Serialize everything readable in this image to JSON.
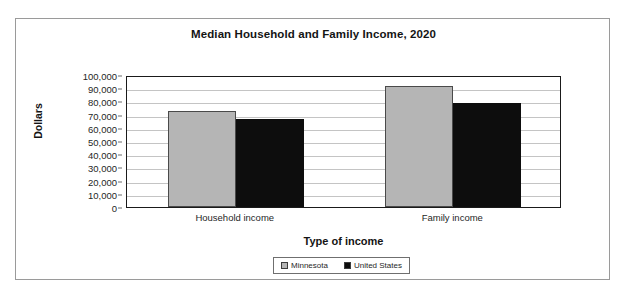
{
  "chart_data": {
    "type": "bar",
    "title": "Median Household and Family Income, 2020",
    "xlabel": "Type of income",
    "ylabel": "Dollars",
    "categories": [
      "Household income",
      "Family income"
    ],
    "series": [
      {
        "name": "Minnesota",
        "color": "#b5b5b5",
        "values": [
          73000,
          92000
        ]
      },
      {
        "name": "United States",
        "color": "#0d0d0d",
        "values": [
          67000,
          79000
        ]
      }
    ],
    "ylim": [
      0,
      100000
    ],
    "ytick_values": [
      0,
      10000,
      20000,
      30000,
      40000,
      50000,
      60000,
      70000,
      80000,
      90000,
      100000
    ],
    "ytick_labels": [
      "0",
      "10,000",
      "20,000",
      "30,000",
      "40,000",
      "50,000",
      "60,000",
      "70,000",
      "80,000",
      "90,000",
      "100,000"
    ],
    "grid": true,
    "legend_position": "bottom",
    "legend_entries": [
      "Minnesota",
      "United States"
    ]
  }
}
